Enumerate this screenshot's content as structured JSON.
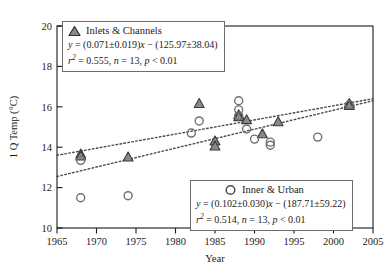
{
  "chart_data": {
    "type": "scatter",
    "title": "",
    "xlabel": "Year",
    "ylabel": "1 Q Temp (°C)",
    "xlim": [
      1965,
      2005
    ],
    "ylim": [
      10,
      20
    ],
    "xticks": [
      1965,
      1970,
      1975,
      1980,
      1985,
      1990,
      1995,
      2000,
      2005
    ],
    "yticks": [
      10,
      12,
      14,
      16,
      18,
      20
    ],
    "grid": false,
    "legend_position": "inside-upper-left and inside-lower-right",
    "series": [
      {
        "name": "Inlets & Channels",
        "marker": "triangle",
        "marker_fill": "#8a8a8a",
        "marker_edge": "#3a3a3a",
        "n": 13,
        "r2": 0.514,
        "points": [
          {
            "x": 1968,
            "y": 13.65
          },
          {
            "x": 1968,
            "y": 13.55
          },
          {
            "x": 1974,
            "y": 13.5
          },
          {
            "x": 1983,
            "y": 16.15
          },
          {
            "x": 1985,
            "y": 14.3
          },
          {
            "x": 1985,
            "y": 14.05
          },
          {
            "x": 1988,
            "y": 15.6
          },
          {
            "x": 1988,
            "y": 15.5
          },
          {
            "x": 1989,
            "y": 15.35
          },
          {
            "x": 1991,
            "y": 14.65
          },
          {
            "x": 1993,
            "y": 15.25
          },
          {
            "x": 2002,
            "y": 16.15
          },
          {
            "x": 2002,
            "y": 16.05
          }
        ],
        "fit": {
          "slope": 0.071,
          "slope_err": 0.019,
          "intercept": 125.97,
          "intercept_err": 38.04,
          "equation": "y = (0.071±0.019)x − (125.97±38.04)",
          "stats": "r2 = 0.555, n = 13, p < 0.01",
          "line_style": "dotted",
          "y_at_xmin": 13.6,
          "y_at_xmax": 16.4
        }
      },
      {
        "name": "Inner & Urban",
        "marker": "circle",
        "marker_fill": "#ffffff",
        "marker_edge": "#6f6f6f",
        "n": 13,
        "r2": 0.514,
        "points": [
          {
            "x": 1968,
            "y": 13.35
          },
          {
            "x": 1968,
            "y": 11.5
          },
          {
            "x": 1974,
            "y": 11.6
          },
          {
            "x": 1982,
            "y": 14.7
          },
          {
            "x": 1983,
            "y": 15.3
          },
          {
            "x": 1988,
            "y": 16.3
          },
          {
            "x": 1988,
            "y": 15.85
          },
          {
            "x": 1988,
            "y": 15.55
          },
          {
            "x": 1989,
            "y": 14.9
          },
          {
            "x": 1990,
            "y": 14.4
          },
          {
            "x": 1992,
            "y": 14.1
          },
          {
            "x": 1992,
            "y": 14.25
          },
          {
            "x": 1998,
            "y": 14.5
          },
          {
            "x": 2002,
            "y": 16.1
          }
        ],
        "fit": {
          "slope": 0.102,
          "slope_err": 0.03,
          "intercept": 187.71,
          "intercept_err": 59.22,
          "equation": "y = (0.102±0.030)x − (187.71±59.22)",
          "stats": "r2 = 0.514, n = 13, p < 0.01",
          "line_style": "dotted",
          "y_at_xmin": 12.55,
          "y_at_xmax": 16.3
        }
      }
    ]
  },
  "axes": {
    "x_title": "Year",
    "y_title": "1 Q Temp (°C)",
    "x_tick_labels": [
      "1965",
      "1970",
      "1975",
      "1980",
      "1985",
      "1990",
      "1995",
      "2000",
      "2005"
    ],
    "y_tick_labels": [
      "10",
      "12",
      "14",
      "16",
      "18",
      "20"
    ]
  },
  "legend_inlets": {
    "title": "Inlets & Channels",
    "equation_pre": "y",
    "equation_body": " = (0.071±0.019)",
    "equation_x": "x",
    "equation_tail": " − (125.97±38.04)",
    "stats_r": "r",
    "stats_sup": "2",
    "stats_body": " = 0.555, ",
    "stats_n": "n",
    "stats_n_val": " = 13, ",
    "stats_p": "p",
    "stats_p_val": " < 0.01",
    "marker_name": "triangle-marker"
  },
  "legend_inner": {
    "title": "Inner & Urban",
    "equation_pre": "y",
    "equation_body": " = (0.102±0.030)",
    "equation_x": "x",
    "equation_tail": " − (187.71±59.22)",
    "stats_r": "r",
    "stats_sup": "2",
    "stats_body": " = 0.514, ",
    "stats_n": "n",
    "stats_n_val": " = 13, ",
    "stats_p": "p",
    "stats_p_val": " < 0.01",
    "marker_name": "circle-marker"
  },
  "colors": {
    "triangle_fill": "#8a8a8a",
    "triangle_edge": "#3a3a3a",
    "circle_edge": "#6f6f6f",
    "axis": "#1b1b1b",
    "trend_line": "#4a4a4a",
    "legend_border": "#6d6d6d"
  }
}
